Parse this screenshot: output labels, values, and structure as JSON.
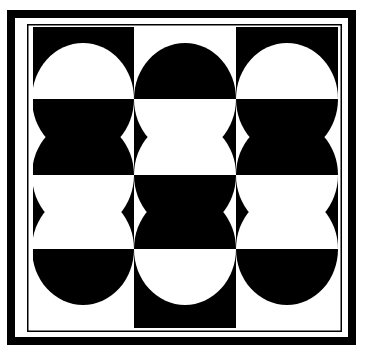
{
  "artwork": {
    "title": "Black and White Checkerboard with Inverted Circles",
    "kind": "op-art-geometric-pattern",
    "canvas": {
      "width": 365,
      "height": 353
    },
    "colors": {
      "black": "#000000",
      "white": "#ffffff",
      "background": "#ffffff"
    },
    "frame": {
      "outer_border": {
        "x": 7,
        "y": 10,
        "width": 349,
        "height": 335,
        "stroke_width": 8,
        "color": "#000000"
      },
      "inner_rule": {
        "x": 27,
        "y": 24,
        "width": 315,
        "height": 308,
        "stroke_width": 1.5,
        "color": "#000000"
      },
      "gap_color": "#ffffff"
    },
    "grid": {
      "x": 33,
      "y": 27,
      "width": 305,
      "height": 301,
      "columns": 3,
      "rows": 4,
      "column_edges": [
        33,
        134,
        236,
        338
      ],
      "row_edges": [
        27,
        99,
        175,
        249,
        328
      ],
      "cells": [
        [
          "black",
          "white",
          "black"
        ],
        [
          "white",
          "black",
          "white"
        ],
        [
          "black",
          "white",
          "black"
        ],
        [
          "white",
          "black",
          "white"
        ]
      ]
    },
    "circles": {
      "count": 9,
      "note": "Ellipses centered on the three interior horizontal grid lines, one per column; each is filled with the inverse of the square behind it.",
      "radius_x": 51,
      "radius_y": 56,
      "centers": [
        {
          "cx": 83,
          "cy": 99,
          "column": 1,
          "boundary_row": 1
        },
        {
          "cx": 185,
          "cy": 99,
          "column": 2,
          "boundary_row": 1
        },
        {
          "cx": 287,
          "cy": 99,
          "column": 3,
          "boundary_row": 1
        },
        {
          "cx": 83,
          "cy": 175,
          "column": 1,
          "boundary_row": 2
        },
        {
          "cx": 185,
          "cy": 175,
          "column": 2,
          "boundary_row": 2
        },
        {
          "cx": 287,
          "cy": 175,
          "column": 3,
          "boundary_row": 2
        },
        {
          "cx": 83,
          "cy": 249,
          "column": 1,
          "boundary_row": 3
        },
        {
          "cx": 185,
          "cy": 249,
          "column": 2,
          "boundary_row": 3
        },
        {
          "cx": 287,
          "cy": 249,
          "column": 3,
          "boundary_row": 3
        }
      ]
    }
  }
}
